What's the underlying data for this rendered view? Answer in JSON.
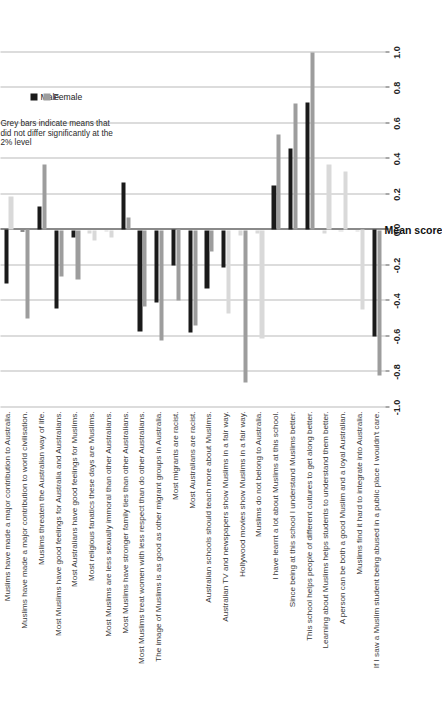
{
  "chart": {
    "type": "bar",
    "orientation": "horizontal",
    "title": "",
    "xlabel": "Mean score",
    "ylabel": "",
    "xlim": [
      -1.0,
      1.0
    ],
    "grid": true,
    "legend_position": "top-left"
  },
  "axis": {
    "title": "Mean score",
    "ticks": [
      "-1.0",
      "-0.8",
      "-0.6",
      "-0.4",
      "-0.2",
      "0.0",
      "0.2",
      "0.4",
      "0.6",
      "0.8",
      "1.0"
    ],
    "tick_values": [
      -1.0,
      -0.8,
      -0.6,
      -0.4,
      -0.2,
      0.0,
      0.2,
      0.4,
      0.6,
      0.8,
      1.0
    ]
  },
  "legend": {
    "items": [
      {
        "label": "Male",
        "color": "#1a1a1a",
        "key": "male"
      },
      {
        "label": "Female",
        "color": "#9d9d9d",
        "key": "female"
      }
    ]
  },
  "annotation": {
    "text": "Grey bars indicate means that did not differ significantly at the 2% level"
  },
  "chart_data": {
    "type": "bar",
    "title": "",
    "xlabel": "Mean score",
    "ylabel": "",
    "xlim": [
      -1.0,
      1.0
    ],
    "grid": true,
    "legend_position": "top-left",
    "annotation": "Grey bars indicate means that did not differ significantly at the 2% level",
    "categories": [
      "Muslims have made a major contribution to Australia.",
      "Muslims have made a major contribution to world civilisation.",
      "Muslims threaten the Australian way of life.",
      "Most Muslims have good feelings for Australia and Australians.",
      "Most Australians have good feelings for Muslims.",
      "Most religious fanatics these days are Muslims.",
      "Most Muslims are less sexually immoral than other Australians.",
      "Most Muslims have stronger family ties than other Australians.",
      "Most Muslims treat women with less respect than do other Australians.",
      "The image of Muslims is as good as other migrant groups in Australia.",
      "Most migrants are racist.",
      "Most Australians are racist.",
      "Australian schools should teach more about Muslims.",
      "Australian TV and newspapers show Muslims in a fair way.",
      "Hollywood movies show Muslims in a fair way.",
      "Muslims do not belong to Australia.",
      "I have learnt a lot about Muslims at this school.",
      "Since being at this school I understand Muslims better.",
      "This school helps people of different cultures to get along better.",
      "Learning about Muslims helps students to understand them better.",
      "A person can be both a good Muslim and a loyal Australian.",
      "Muslims find it hard to integrate into Australia.",
      "If I saw a Muslim student being abused in a public place I wouldn't care."
    ],
    "series": [
      {
        "name": "Male",
        "color": "#1a1a1a",
        "values": [
          -0.3,
          -0.01,
          0.13,
          -0.44,
          -0.04,
          -0.02,
          -0.01,
          0.27,
          -0.57,
          -0.41,
          -0.2,
          -0.58,
          -0.33,
          -0.21,
          -0.03,
          -0.02,
          0.25,
          0.46,
          0.72,
          -0.02,
          -0.01,
          -0.01,
          -0.6
        ],
        "significant": [
          true,
          true,
          true,
          true,
          true,
          false,
          false,
          true,
          true,
          true,
          true,
          true,
          true,
          true,
          false,
          false,
          true,
          true,
          true,
          false,
          false,
          false,
          true
        ]
      },
      {
        "name": "Female",
        "color": "#9d9d9d",
        "values": [
          0.19,
          -0.5,
          0.37,
          -0.26,
          -0.28,
          -0.06,
          -0.04,
          0.07,
          -0.43,
          -0.62,
          -0.4,
          -0.54,
          -0.12,
          -0.47,
          -0.86,
          -0.61,
          0.54,
          0.71,
          1.0,
          0.37,
          0.33,
          -0.45,
          -0.82
        ],
        "significant": [
          false,
          true,
          true,
          true,
          true,
          false,
          false,
          true,
          true,
          true,
          true,
          true,
          true,
          false,
          true,
          false,
          true,
          true,
          true,
          false,
          false,
          false,
          true
        ]
      }
    ]
  }
}
